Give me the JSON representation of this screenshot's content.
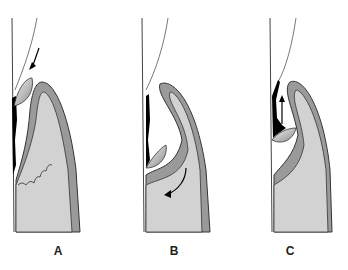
{
  "figure": {
    "panels": [
      {
        "label": "A",
        "step": "insertion",
        "arrow": "down-left"
      },
      {
        "label": "B",
        "step": "engagement",
        "arrow": "curved-around-base"
      },
      {
        "label": "C",
        "step": "removal-stroke",
        "arrow": "up"
      }
    ],
    "colors": {
      "gingiva_outer": "#9a9a9a",
      "gingiva_inner": "#d2d2d2",
      "outline": "#333333",
      "calculus": "#000000",
      "tooth_line": "#444444",
      "curette_light": "#f0f0f0",
      "curette_dark": "#8c8c8c"
    }
  }
}
